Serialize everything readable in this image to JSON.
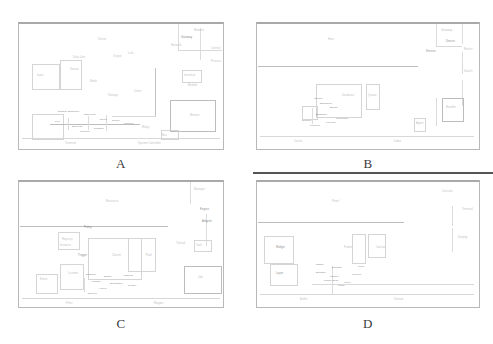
{
  "figure": {
    "caption_style": "panel letters below each panel",
    "background_color": "#ffffff",
    "border_color": "#b9b9b9",
    "rule_color": "#555555",
    "text_color": "#9a9a9a"
  },
  "panels": [
    {
      "id": "A",
      "label": "A",
      "position": "top-left",
      "description": "faint scanned schematic diagram with boxes, connector lines and micro-labels",
      "labels": [
        "Remote",
        "Gateway",
        "Server",
        "Network",
        "Control",
        "Interface",
        "Module",
        "Process",
        "Data Unit",
        "Sensor",
        "Input",
        "Output",
        "Link",
        "Node",
        "Storage",
        "Client",
        "Monitor",
        "Relay",
        "Bus",
        "Terminal",
        "System Controller",
        "Main Unit",
        "Sub Unit",
        "Transfer",
        "Signal",
        "Channel",
        "Port",
        "Buffer",
        "Register"
      ]
    },
    {
      "id": "B",
      "label": "B",
      "position": "top-right",
      "description": "faint scanned schematic diagram, sparse boxes with a long horizontal divider",
      "labels": [
        "Gateway",
        "Device",
        "Service",
        "Router",
        "Switch",
        "Host",
        "Database",
        "Queue",
        "Handler",
        "Agent",
        "Cache",
        "Index",
        "Worker",
        "Scheduler",
        "Broker",
        "Endpoint",
        "Session",
        "Request",
        "Response",
        "Payload"
      ]
    },
    {
      "id": "C",
      "label": "C",
      "position": "bottom-left",
      "description": "faint scanned schematic diagram with a cluster of connected boxes in the lower left",
      "labels": [
        "Manager",
        "Engine",
        "Adapter",
        "Resource",
        "Policy",
        "Registry",
        "Instance",
        "Cluster",
        "Pool",
        "Thread",
        "Task",
        "Job",
        "Trigger",
        "Event",
        "Listener",
        "Filter",
        "Mapper",
        "Reducer",
        "Shard",
        "Replica",
        "Primary",
        "Secondary",
        "Archive",
        "Backup"
      ]
    },
    {
      "id": "D",
      "label": "D",
      "position": "bottom-right",
      "description": "faint scanned schematic diagram with a dense text cluster near the lower centre",
      "labels": [
        "Console",
        "Terminal",
        "Display",
        "Panel",
        "Widget",
        "Layer",
        "Frame",
        "Canvas",
        "Buffer",
        "Stream",
        "Codec",
        "Decoder",
        "Encoder",
        "Packet",
        "Frame Sync",
        "Clock",
        "Timer",
        "Counter",
        "Latch"
      ]
    }
  ]
}
